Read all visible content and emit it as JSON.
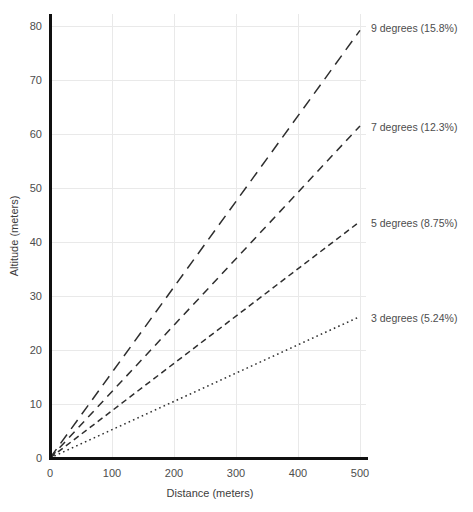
{
  "chart_data": {
    "type": "line",
    "title": "",
    "subtitle": "",
    "xlabel": "Distance (meters)",
    "ylabel": "Altitude (meters)",
    "xlim": [
      0,
      500
    ],
    "ylim": [
      0,
      80
    ],
    "x": [
      0,
      500
    ],
    "xticks": [
      "0",
      "100",
      "200",
      "300",
      "400",
      "500"
    ],
    "xtick_values": [
      0,
      100,
      200,
      300,
      400,
      500
    ],
    "yticks": [
      "0",
      "10",
      "20",
      "30",
      "40",
      "50",
      "60",
      "70",
      "80"
    ],
    "ytick_values": [
      0,
      10,
      20,
      30,
      40,
      50,
      60,
      70,
      80
    ],
    "grid": true,
    "legend_position": "right-inline-end-of-line",
    "series": [
      {
        "name": "9 degrees (15.8%)",
        "degrees": 9,
        "grade_percent": 15.8,
        "slope": 0.158,
        "values": [
          0,
          79.2
        ],
        "dash": "long-dash",
        "dasharray": "11 7"
      },
      {
        "name": "7 degrees (12.3%)",
        "degrees": 7,
        "grade_percent": 12.3,
        "slope": 0.123,
        "values": [
          0,
          61.5
        ],
        "dash": "medium-dash",
        "dasharray": "8 6"
      },
      {
        "name": "5 degrees (8.75%)",
        "degrees": 5,
        "grade_percent": 8.75,
        "slope": 0.0875,
        "values": [
          0,
          43.8
        ],
        "dash": "short-dash",
        "dasharray": "6 4"
      },
      {
        "name": "3 degrees (5.24%)",
        "degrees": 3,
        "grade_percent": 5.24,
        "slope": 0.0524,
        "values": [
          0,
          26.2
        ],
        "dash": "dotted",
        "dasharray": "1.6 3.2"
      }
    ],
    "colors": {
      "line": "#2e2e2e",
      "grid": "#e9e9e9",
      "axis": "#101010",
      "text": "#4d4d4d",
      "background": "#ffffff"
    }
  }
}
